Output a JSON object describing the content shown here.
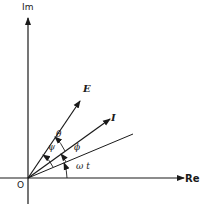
{
  "diagram": {
    "type": "phasor-diagram",
    "axes": {
      "imaginary_label": "Im",
      "real_label": "Re",
      "origin_label": "O"
    },
    "vectors": [
      {
        "name": "E",
        "label": "E"
      },
      {
        "name": "I",
        "label": "I"
      }
    ],
    "reference_line": {
      "label": "ωt"
    },
    "angles": {
      "theta": "θ",
      "psi": "ψ",
      "phi": "ϕ",
      "omega_t": "ω t"
    },
    "colors": {
      "ink": "#1a1a1a",
      "background": "#ffffff"
    }
  }
}
